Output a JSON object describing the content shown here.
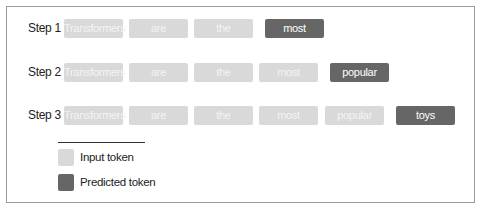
{
  "diagram": {
    "steps": [
      {
        "label": "Step 1",
        "input_tokens": [
          "Transformers",
          "are",
          "the"
        ],
        "predicted_token": "most"
      },
      {
        "label": "Step 2",
        "input_tokens": [
          "Transformers",
          "are",
          "the",
          "most"
        ],
        "predicted_token": "popular"
      },
      {
        "label": "Step 3",
        "input_tokens": [
          "Transformers",
          "are",
          "the",
          "most",
          "popular"
        ],
        "predicted_token": "toys"
      }
    ],
    "legend": {
      "input_label": "Input token",
      "predicted_label": "Predicted token"
    },
    "colors": {
      "input_token": "#d9d9d9",
      "predicted_token": "#666666",
      "frame_border": "#9a9a9a"
    }
  }
}
